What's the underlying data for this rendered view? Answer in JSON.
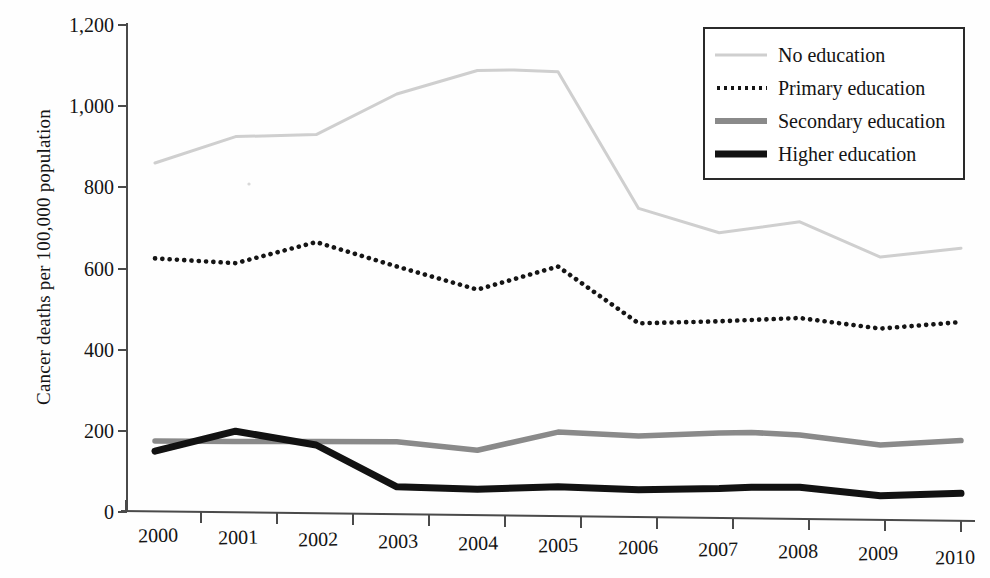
{
  "chart_data": {
    "type": "line",
    "title": "",
    "xlabel": "",
    "ylabel": "Cancer deaths per 100,000 population",
    "x": [
      2000,
      2001,
      2002,
      2003,
      2004,
      2005,
      2006,
      2007,
      2008,
      2009,
      2010
    ],
    "categories": [
      "2000",
      "2001",
      "2002",
      "2003",
      "2004",
      "2005",
      "2006",
      "2007",
      "2008",
      "2009",
      "2010"
    ],
    "xlim": [
      2000,
      2010
    ],
    "ylim": [
      0,
      1200
    ],
    "yticks": [
      0,
      200,
      400,
      600,
      800,
      1000,
      1200
    ],
    "ytick_labels": [
      "0",
      "200",
      "400",
      "600",
      "800",
      "1,000",
      "1,200"
    ],
    "grid": false,
    "legend_position": "top-right",
    "series": [
      {
        "name": "No education",
        "style": "solid-thin",
        "color": "#cfcfcf",
        "values": [
          860,
          925,
          930,
          1030,
          1088,
          1085,
          748,
          688,
          715,
          628,
          650
        ]
      },
      {
        "name": "Primary education",
        "style": "dotted",
        "color": "#151515",
        "values": [
          625,
          613,
          665,
          605,
          548,
          605,
          465,
          470,
          478,
          452,
          468
        ]
      },
      {
        "name": "Secondary education",
        "style": "solid-medium",
        "color": "#8a8a8a",
        "values": [
          175,
          174,
          174,
          173,
          152,
          197,
          187,
          195,
          190,
          165,
          176
        ]
      },
      {
        "name": "Higher education",
        "style": "solid-thick",
        "color": "#121212",
        "values": [
          150,
          199,
          165,
          62,
          56,
          62,
          55,
          58,
          61,
          40,
          46
        ]
      }
    ]
  },
  "legend": {
    "items": [
      {
        "label": "No education",
        "swatch": "line-light-gray"
      },
      {
        "label": "Primary education",
        "swatch": "line-dotted-black"
      },
      {
        "label": "Secondary education",
        "swatch": "line-gray"
      },
      {
        "label": "Higher education",
        "swatch": "line-black"
      }
    ]
  },
  "axes": {
    "y_title": "Cancer deaths per 100,000 population",
    "y_tick_labels": [
      "1,200",
      "1,000",
      "800",
      "600",
      "400",
      "200",
      "0"
    ],
    "x_tick_labels": [
      "2000",
      "2001",
      "2002",
      "2003",
      "2004",
      "2005",
      "2006",
      "2007",
      "2008",
      "2009",
      "2010"
    ]
  }
}
